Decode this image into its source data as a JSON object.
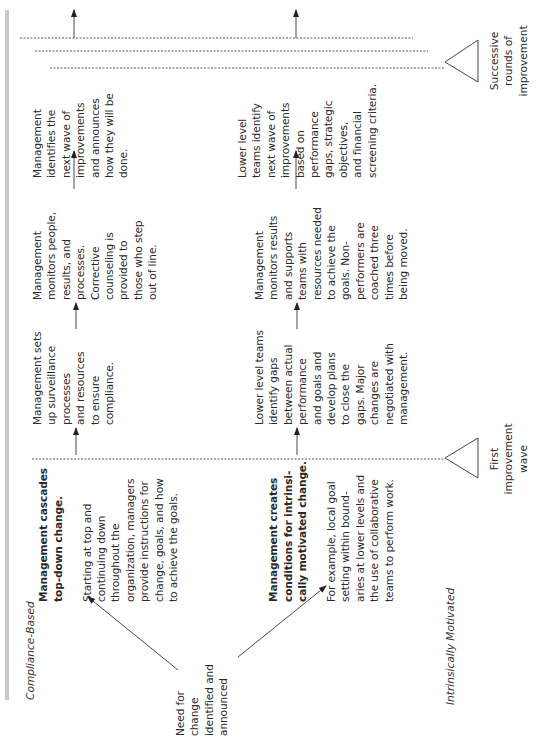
{
  "diagram": {
    "row_labels": {
      "compliance": "Compliance-Based",
      "intrinsic": "Intrinsically Motivated"
    },
    "start_node": "Need for\nchange\nidentified and\nannounced",
    "compliance_row": [
      {
        "heading": "Management cascades\ntop-down change.",
        "body": "Starting at top and\ncontinuing down\nthroughout the\norganization, managers\nprovide instructions for\nchange, goals, and how\nto achieve the goals."
      },
      {
        "body": "Management sets\nup surveillance\nprocesses\nand resources\nto ensure\ncompliance."
      },
      {
        "body": "Management\nmonitors people,\nresults, and\nprocesses.\nCorrective\ncounseling is\nprovided to\nthose who step\nout of line."
      },
      {
        "body": "Management\nidentifies the\nnext wave of\nimprovements\nand announces\nhow they will be\ndone."
      }
    ],
    "intrinsic_row": [
      {
        "heading": "Management creates\nconditions for intrinsi-\ncally motivated change.",
        "body": "For example, local goal\nsetting within bound-\naries at lower levels and\nthe use of collaborative\nteams to perform work."
      },
      {
        "body": "Lower level teams\nidentify gaps\nbetween actual\nperformance\nand goals and\ndevelop plans\nto close the\ngaps. Major\nchanges are\nnegotiated with\nmanagement."
      },
      {
        "body": "Management\nmonitors results\nand supports\nteams with\nresources needed\nto achieve the\ngoals. Non-\nperformers are\ncoached three\ntimes before\nbeing moved."
      },
      {
        "body": "Lower level\nteams identify\nnext wave of\nimprovements\nbased on\nperformance\ngaps, strategic\nobjectives,\nand financial\nscreening criteria."
      }
    ],
    "markers": {
      "first_wave": "First\nimprovement\nwave",
      "successive": "Successive\nrounds of\nimprovement"
    },
    "colors": {
      "text": "#2a2a2a",
      "side_bar": "#c8c8c8",
      "lines": "#333333"
    }
  }
}
